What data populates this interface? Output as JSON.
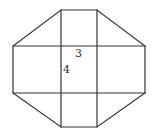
{
  "diagram": {
    "line_color": "#333333",
    "background": "#ffffff",
    "labels": [
      {
        "id": "top-side-length",
        "text": "3",
        "x": 75,
        "y": 48
      },
      {
        "id": "left-side-length",
        "text": "4",
        "x": 63,
        "y": 64
      }
    ],
    "vertices": {
      "octagon": [
        [
          61,
          10
        ],
        [
          97,
          10
        ],
        [
          145,
          46
        ],
        [
          145,
          93
        ],
        [
          97,
          127
        ],
        [
          61,
          127
        ],
        [
          13,
          93
        ],
        [
          13,
          46
        ]
      ],
      "inner_verticals_x": [
        61,
        97
      ],
      "inner_horizontals_y": [
        46,
        93
      ]
    }
  }
}
